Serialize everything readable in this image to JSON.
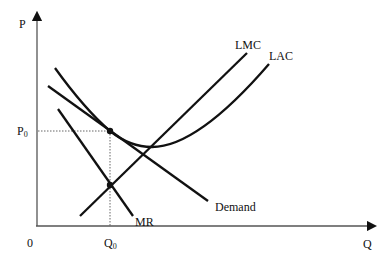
{
  "diagram": {
    "type": "economics-monopolistic-competition-long-run",
    "axes": {
      "y_label": "P",
      "x_label": "Q",
      "origin_label": "0"
    },
    "markers": {
      "price_label": "P",
      "price_subscript": "0",
      "quantity_label": "Q",
      "quantity_subscript": "0"
    },
    "curves": [
      {
        "id": "lmc",
        "label": "LMC",
        "shape": "line"
      },
      {
        "id": "lac",
        "label": "LAC",
        "shape": "u-curve"
      },
      {
        "id": "demand",
        "label": "Demand",
        "shape": "line"
      },
      {
        "id": "mr",
        "label": "MR",
        "shape": "line"
      }
    ],
    "points": [
      {
        "id": "tangency",
        "description": "Demand tangent to LAC at (Q0, P0)"
      },
      {
        "id": "mr-lmc",
        "description": "MR intersects LMC at Q0"
      }
    ],
    "colors": {
      "line": "#111111",
      "guide": "#555555",
      "background": "#ffffff"
    }
  }
}
